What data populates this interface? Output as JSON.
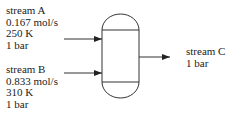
{
  "diagram": {
    "type": "process-flow-mixer",
    "vessel": {
      "name": "mixing vessel"
    },
    "streams": [
      {
        "id": "A",
        "lines": [
          "stream A",
          "0.167 mol/s",
          "250 K",
          "1 bar"
        ],
        "direction": "inlet"
      },
      {
        "id": "B",
        "lines": [
          "stream B",
          "0.833 mol/s",
          "310 K",
          "1 bar"
        ],
        "direction": "inlet"
      },
      {
        "id": "C",
        "lines": [
          "stream C",
          "1 bar"
        ],
        "direction": "outlet"
      }
    ],
    "colors": {
      "stroke": "#333333",
      "text": "#222222",
      "background": "#ffffff"
    }
  }
}
